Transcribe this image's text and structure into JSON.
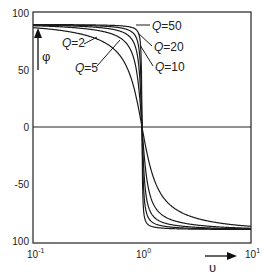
{
  "chart_data": {
    "type": "line",
    "title": "",
    "xlabel": "υ",
    "ylabel": "φ",
    "xscale": "log",
    "xlim": [
      0.1,
      10
    ],
    "ylim": [
      -100,
      100
    ],
    "grid": false,
    "x_ticks": [
      {
        "value": 0.1,
        "base": "10",
        "exp": "-1"
      },
      {
        "value": 1,
        "base": "10",
        "exp": "0"
      },
      {
        "value": 10,
        "base": "10",
        "exp": "1"
      }
    ],
    "y_ticks": [
      {
        "value": 100,
        "label": "100"
      },
      {
        "value": 50,
        "label": "50"
      },
      {
        "value": 0,
        "label": "0"
      },
      {
        "value": -50,
        "label": "-50"
      },
      {
        "value": -100,
        "label": "100"
      }
    ],
    "formula": "phi = atan(Q*(1/v - v)) in degrees",
    "series": [
      {
        "name": "Q=2",
        "Q": 2
      },
      {
        "name": "Q=5",
        "Q": 5
      },
      {
        "name": "Q=10",
        "Q": 10
      },
      {
        "name": "Q=20",
        "Q": 20
      },
      {
        "name": "Q=50",
        "Q": 50
      }
    ],
    "annotations": [
      {
        "text_q": "Q",
        "text_v": "=2",
        "x": 62,
        "y": 47,
        "leader": [
          84,
          44,
          97,
          37
        ]
      },
      {
        "text_q": "Q",
        "text_v": "=5",
        "x": 75,
        "y": 72,
        "leader": [
          97,
          66,
          120,
          40
        ]
      },
      {
        "text_q": "Q",
        "text_v": "=50",
        "x": 152,
        "y": 30,
        "leader": [
          150,
          25,
          136,
          25
        ]
      },
      {
        "text_q": "Q",
        "text_v": "=20",
        "x": 154,
        "y": 51,
        "leader": [
          152,
          46,
          138,
          33
        ]
      },
      {
        "text_q": "Q",
        "text_v": "=10",
        "x": 155,
        "y": 71,
        "leader": [
          153,
          66,
          140,
          45
        ]
      }
    ]
  }
}
